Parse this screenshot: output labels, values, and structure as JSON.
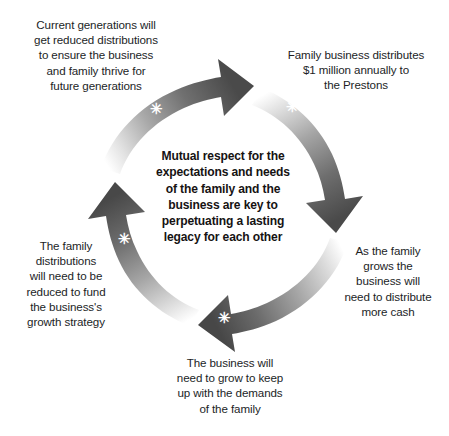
{
  "diagram": {
    "type": "cycle",
    "center_text": "Mutual respect for the\nexpectations and needs\nof the family and the\nbusiness are key to\nperpetuating a lasting\nlegacy for each other",
    "colors": {
      "text": "#221e1f",
      "center_text": "#161313",
      "arrow_dark": "#4a4a4a",
      "arrow_mid": "#8d8d8d",
      "arrow_light": "#ffffff",
      "marker": "#ffffff",
      "background": "#ffffff"
    },
    "marker_glyph": "✳",
    "steps": [
      {
        "id": "top-right",
        "label": "Family business distributes\n$1 million annually to\nthe Prestons"
      },
      {
        "id": "right",
        "label": "As the family\ngrows the\nbusiness will\nneed to distribute\nmore cash"
      },
      {
        "id": "bottom",
        "label": "The business will\nneed to grow to keep\nup with the demands\nof the family"
      },
      {
        "id": "left",
        "label": "The family\ndistributions\nwill need to be\nreduced to fund\nthe business's\ngrowth strategy"
      },
      {
        "id": "top-left",
        "label": "Current generations will\nget reduced distributions\nto ensure the business\nand family thrive for\nfuture generations"
      }
    ]
  }
}
